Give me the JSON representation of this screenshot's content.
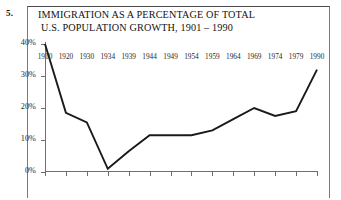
{
  "question_number": "5.",
  "figure": {
    "title_line_1": "IMMIGRATION AS A PERCENTAGE OF TOTAL",
    "title_line_2": "U.S. POPULATION GROWTH, 1901 – 1990"
  },
  "chart_data": {
    "type": "line",
    "title": "IMMIGRATION AS A PERCENTAGE OF TOTAL U.S. POPULATION GROWTH, 1901 – 1990",
    "xlabel": "",
    "ylabel": "",
    "grid": false,
    "legend": false,
    "line_color": "#1a1a1a",
    "axis_color": "#6f6f6f",
    "categories": [
      "1910",
      "1920",
      "1930",
      "1934",
      "1939",
      "1944",
      "1949",
      "1954",
      "1959",
      "1964",
      "1969",
      "1974",
      "1979",
      "1990"
    ],
    "x_tick_labels": [
      "1910",
      "1920",
      "1930",
      "1934",
      "1939",
      "1944",
      "1949",
      "1954",
      "1959",
      "1964",
      "1969",
      "1974",
      "1979",
      "1990"
    ],
    "values": [
      40.0,
      18.5,
      15.5,
      1.0,
      6.5,
      11.5,
      11.5,
      11.5,
      13.0,
      16.5,
      20.0,
      17.5,
      19.0,
      32.0
    ],
    "y_tick_labels": [
      "0%",
      "10%",
      "20%",
      "30%",
      "40%"
    ],
    "y_tick_values": [
      0,
      10,
      20,
      30,
      40
    ],
    "ylim": [
      0,
      40
    ],
    "xlim": [
      1910,
      1990
    ],
    "unit": "%"
  }
}
